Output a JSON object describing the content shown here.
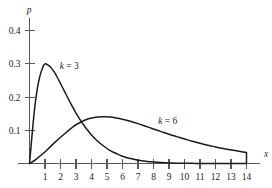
{
  "chart_data": {
    "type": "line",
    "title": "",
    "subtitle": "",
    "xlabel": "x",
    "ylabel": "p",
    "xlim": [
      0,
      14.6
    ],
    "ylim": [
      0,
      0.45
    ],
    "grid": false,
    "legend_position": "inline-annotation",
    "x_ticks": [
      {
        "value": 1,
        "label": "1"
      },
      {
        "value": 2,
        "label": "2"
      },
      {
        "value": 3,
        "label": "3"
      },
      {
        "value": 4,
        "label": "4"
      },
      {
        "value": 5,
        "label": "5"
      },
      {
        "value": 6,
        "label": "6"
      },
      {
        "value": 7,
        "label": "7"
      },
      {
        "value": 8,
        "label": "8"
      },
      {
        "value": 9,
        "label": "9"
      },
      {
        "value": 10,
        "label": "10"
      },
      {
        "value": 11,
        "label": "11"
      },
      {
        "value": 12,
        "label": "12"
      },
      {
        "value": 13,
        "label": "13"
      },
      {
        "value": 14,
        "label": "14"
      }
    ],
    "y_ticks": [
      {
        "value": 0.1,
        "label": "0.1"
      },
      {
        "value": 0.2,
        "label": "0.2"
      },
      {
        "value": 0.3,
        "label": "0.3"
      },
      {
        "value": 0.4,
        "label": "0.4"
      }
    ],
    "annotations": [
      {
        "text_k": "k",
        "text_eq": "=",
        "text_val": "3",
        "x": 1.95,
        "y": 0.285
      },
      {
        "text_k": "k",
        "text_eq": "=",
        "text_val": "6",
        "x": 8.3,
        "y": 0.118
      }
    ],
    "series": [
      {
        "name": "k = 3",
        "k": 3,
        "color": "#1a1a1a",
        "x": [
          0,
          0.15,
          0.3,
          0.45,
          0.6,
          0.75,
          0.9,
          1.0,
          1.1,
          1.25,
          1.4,
          1.6,
          1.8,
          2.0,
          2.25,
          2.5,
          2.75,
          3.0,
          3.3,
          3.6,
          4.0,
          4.4,
          4.8,
          5.2,
          5.6,
          6.0,
          6.5,
          7.0,
          7.5,
          8.0,
          8.5,
          9.0,
          9.5,
          10.0,
          10.5,
          11.0,
          11.5,
          12.0,
          13.0,
          14.0
        ],
        "y": [
          0.0,
          0.078,
          0.152,
          0.209,
          0.249,
          0.276,
          0.294,
          0.3,
          0.299,
          0.295,
          0.288,
          0.275,
          0.259,
          0.241,
          0.218,
          0.195,
          0.173,
          0.152,
          0.129,
          0.109,
          0.086,
          0.067,
          0.052,
          0.039,
          0.03,
          0.022,
          0.015,
          0.01,
          0.0065,
          0.0042,
          0.0027,
          0.0017,
          0.0011,
          0.0007,
          0.0004,
          0.00025,
          0.00016,
          0.0001,
          4e-05,
          0.0
        ]
      },
      {
        "name": "k = 6",
        "k": 6,
        "color": "#1a1a1a",
        "x": [
          0,
          0.4,
          0.8,
          1.2,
          1.6,
          2.0,
          2.4,
          2.8,
          3.2,
          3.6,
          4.0,
          4.4,
          4.8,
          5.2,
          5.6,
          6.0,
          6.5,
          7.0,
          7.5,
          8.0,
          8.5,
          9.0,
          9.5,
          10.0,
          10.5,
          11.0,
          11.5,
          12.0,
          12.5,
          13.0,
          13.5,
          14.0
        ],
        "y": [
          0.0,
          0.012,
          0.027,
          0.044,
          0.062,
          0.079,
          0.095,
          0.11,
          0.122,
          0.131,
          0.137,
          0.14,
          0.141,
          0.14,
          0.137,
          0.133,
          0.127,
          0.12,
          0.112,
          0.104,
          0.096,
          0.088,
          0.081,
          0.074,
          0.067,
          0.061,
          0.055,
          0.05,
          0.045,
          0.041,
          0.037,
          0.033
        ]
      }
    ]
  },
  "geometry": {
    "origin_x": 29.5,
    "origin_y": 163.5,
    "px_per_x": 15.5,
    "px_per_y": 332,
    "x_axis_end": 260,
    "y_axis_top": 18,
    "x_tick_len": 5,
    "y_tick_len": 5,
    "x_label_offset": 13,
    "y_label_offset": 9,
    "axis_name_x": {
      "x": 264,
      "y": 157
    },
    "axis_name_y": {
      "x": 29,
      "y": 13
    }
  }
}
